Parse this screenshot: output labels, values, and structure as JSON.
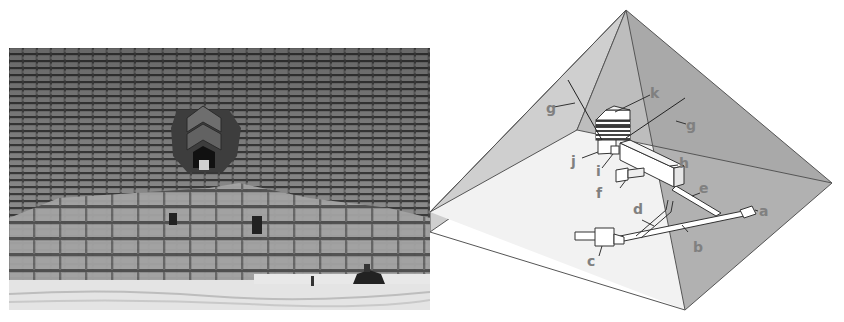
{
  "photo": {
    "subject": "pyramid-entrance-photo",
    "tone": "grayscale"
  },
  "diagram": {
    "colors": {
      "left_face": "#cfcfcf",
      "front_face": "#f2f2f2",
      "right_face": "#a6a6a6",
      "back_face": "#bdbdbd",
      "edge": "#555555",
      "structure_fill": "#ffffff",
      "structure_stroke": "#333333",
      "label": "#808080"
    },
    "labels": [
      {
        "id": "a",
        "text": "a"
      },
      {
        "id": "b",
        "text": "b"
      },
      {
        "id": "c",
        "text": "c"
      },
      {
        "id": "d",
        "text": "d"
      },
      {
        "id": "e",
        "text": "e"
      },
      {
        "id": "f",
        "text": "f"
      },
      {
        "id": "g1",
        "text": "g"
      },
      {
        "id": "g2",
        "text": "g"
      },
      {
        "id": "h",
        "text": "h"
      },
      {
        "id": "i",
        "text": "i"
      },
      {
        "id": "j",
        "text": "j"
      },
      {
        "id": "k",
        "text": "k"
      }
    ]
  }
}
